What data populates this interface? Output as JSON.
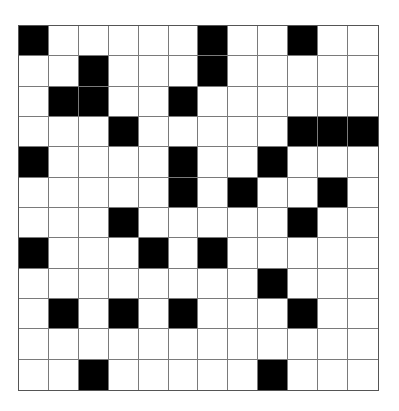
{
  "puzzle": {
    "type": "crossword-grid",
    "rows": 12,
    "cols": 12,
    "colors": {
      "block": "#000000",
      "open": "#ffffff",
      "gridline": "#7a7a7a",
      "border": "#555555"
    },
    "black_cells": [
      [
        0,
        0
      ],
      [
        0,
        6
      ],
      [
        0,
        9
      ],
      [
        1,
        2
      ],
      [
        1,
        6
      ],
      [
        2,
        1
      ],
      [
        2,
        2
      ],
      [
        2,
        5
      ],
      [
        3,
        3
      ],
      [
        3,
        9
      ],
      [
        3,
        10
      ],
      [
        3,
        11
      ],
      [
        4,
        0
      ],
      [
        4,
        5
      ],
      [
        4,
        8
      ],
      [
        5,
        5
      ],
      [
        5,
        7
      ],
      [
        5,
        10
      ],
      [
        6,
        3
      ],
      [
        6,
        9
      ],
      [
        7,
        0
      ],
      [
        7,
        4
      ],
      [
        7,
        6
      ],
      [
        8,
        8
      ],
      [
        9,
        1
      ],
      [
        9,
        3
      ],
      [
        9,
        5
      ],
      [
        9,
        9
      ],
      [
        11,
        2
      ],
      [
        11,
        8
      ]
    ],
    "grid": [
      "#.....#..#..",
      "..#...#.....",
      ".##..#......",
      "...#.....###",
      "#....#..#...",
      ".....#.#..#.",
      "...#.....#..",
      "#...#.#.....",
      "........#...",
      ".#.#.#...#..",
      "............",
      "..#.....#..."
    ]
  }
}
